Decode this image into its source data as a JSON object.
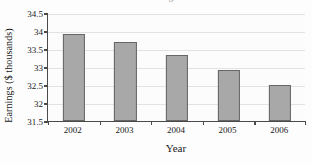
{
  "chart_data": {
    "type": "bar",
    "title": "",
    "xlabel": "Year",
    "ylabel": "Earnings ($ thousands)",
    "categories": [
      "2002",
      "2003",
      "2004",
      "2005",
      "2006"
    ],
    "values": [
      33.93,
      33.7,
      33.33,
      32.92,
      32.51
    ],
    "ylim": [
      31.5,
      34.5
    ],
    "yticks": [
      "34.5",
      "34",
      "33.5",
      "33",
      "32.5",
      "32",
      "31.5"
    ],
    "ytick_values": [
      34.5,
      34,
      33.5,
      33,
      32.5,
      32,
      31.5
    ],
    "grid": true,
    "legend": false,
    "legend_position": "none",
    "bar_color": "#a8a8a8",
    "bar_border_color": "#666666",
    "gridline_color": "#e2e2e2",
    "axis_color": "#4a4a4a",
    "background_color": "#fcfcfc",
    "title_fragment": "g"
  }
}
